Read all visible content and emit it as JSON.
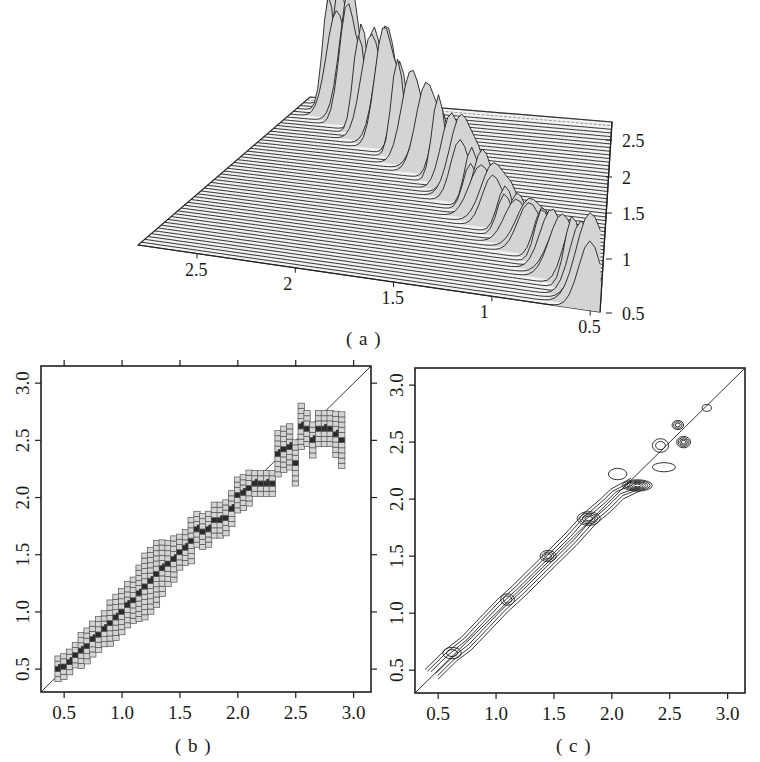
{
  "captions": {
    "a": "( a )",
    "b": "( b )",
    "c": "( c )"
  },
  "colors": {
    "ink": "#1f1f1f",
    "fill_light": "#d4d4d4",
    "fill_dark": "#2a2a2a",
    "background": "#ffffff",
    "surface_line": "#555555"
  },
  "chart_data": [
    {
      "id": "a",
      "type": "surface",
      "title": "",
      "description": "3D waterfall/perspective density surface with a diagonal ridge of peaks",
      "x_axis": {
        "ticks": [
          2.5,
          2,
          1.5,
          1,
          0.5
        ],
        "labels": [
          "2.5",
          "2",
          "1.5",
          "1",
          "0.5"
        ]
      },
      "z_axis": {
        "ticks": [
          2.5,
          2,
          1.5,
          1,
          0.5
        ],
        "labels": [
          "2.5",
          "2",
          "1.5",
          "1",
          "0.5"
        ]
      },
      "grid_lines": 52,
      "ridge_peaks": [
        {
          "t": 0.02,
          "x": 0.5,
          "h": 95
        },
        {
          "t": 0.06,
          "x": 0.55,
          "h": 80
        },
        {
          "t": 0.1,
          "x": 0.6,
          "h": 78
        },
        {
          "t": 0.14,
          "x": 0.66,
          "h": 72
        },
        {
          "t": 0.18,
          "x": 0.72,
          "h": 70
        },
        {
          "t": 0.22,
          "x": 0.78,
          "h": 62
        },
        {
          "t": 0.26,
          "x": 0.86,
          "h": 60
        },
        {
          "t": 0.3,
          "x": 0.94,
          "h": 55
        },
        {
          "t": 0.34,
          "x": 1.02,
          "h": 52
        },
        {
          "t": 0.38,
          "x": 1.1,
          "h": 66
        },
        {
          "t": 0.42,
          "x": 1.18,
          "h": 70
        },
        {
          "t": 0.46,
          "x": 1.26,
          "h": 62
        },
        {
          "t": 0.5,
          "x": 1.34,
          "h": 85
        },
        {
          "t": 0.54,
          "x": 1.42,
          "h": 80
        },
        {
          "t": 0.58,
          "x": 1.52,
          "h": 92
        },
        {
          "t": 0.62,
          "x": 1.62,
          "h": 98
        },
        {
          "t": 0.66,
          "x": 1.74,
          "h": 105
        },
        {
          "t": 0.7,
          "x": 1.86,
          "h": 110
        },
        {
          "t": 0.74,
          "x": 1.98,
          "h": 140
        },
        {
          "t": 0.78,
          "x": 2.1,
          "h": 125
        },
        {
          "t": 0.82,
          "x": 2.22,
          "h": 118
        },
        {
          "t": 0.86,
          "x": 2.34,
          "h": 150
        },
        {
          "t": 0.9,
          "x": 2.46,
          "h": 135
        },
        {
          "t": 0.94,
          "x": 2.56,
          "h": 150
        }
      ]
    },
    {
      "id": "b",
      "type": "heatmap",
      "title": "",
      "xlabel": "",
      "ylabel": "",
      "xlim": [
        0.3,
        3.15
      ],
      "ylim": [
        0.3,
        3.15
      ],
      "x_ticks": [
        0.5,
        1.0,
        1.5,
        2.0,
        2.5,
        3.0
      ],
      "x_tick_labels": [
        "0.5",
        "1.0",
        "1.5",
        "2.0",
        "2.5",
        "3.0"
      ],
      "y_ticks": [
        0.5,
        1.0,
        1.5,
        2.0,
        2.5,
        3.0
      ],
      "y_tick_labels": [
        "0.5",
        "1.0",
        "1.5",
        "2.0",
        "2.5",
        "3.0"
      ],
      "reference_line": "y = x",
      "cell_w": 0.06,
      "cell_h": 0.05,
      "path": [
        [
          0.45,
          0.5
        ],
        [
          0.5,
          0.52
        ],
        [
          0.55,
          0.56
        ],
        [
          0.6,
          0.62
        ],
        [
          0.65,
          0.66
        ],
        [
          0.7,
          0.7
        ],
        [
          0.75,
          0.76
        ],
        [
          0.8,
          0.8
        ],
        [
          0.85,
          0.85
        ],
        [
          0.9,
          0.9
        ],
        [
          0.95,
          0.95
        ],
        [
          1.0,
          1.0
        ],
        [
          1.05,
          1.06
        ],
        [
          1.1,
          1.1
        ],
        [
          1.15,
          1.16
        ],
        [
          1.2,
          1.22
        ],
        [
          1.25,
          1.27
        ],
        [
          1.3,
          1.33
        ],
        [
          1.35,
          1.38
        ],
        [
          1.4,
          1.42
        ],
        [
          1.45,
          1.46
        ],
        [
          1.5,
          1.52
        ],
        [
          1.55,
          1.56
        ],
        [
          1.6,
          1.62
        ],
        [
          1.65,
          1.72
        ],
        [
          1.7,
          1.7
        ],
        [
          1.75,
          1.72
        ],
        [
          1.8,
          1.8
        ],
        [
          1.85,
          1.8
        ],
        [
          1.9,
          1.82
        ],
        [
          1.95,
          1.9
        ],
        [
          2.0,
          2.02
        ],
        [
          2.05,
          2.04
        ],
        [
          2.1,
          2.08
        ],
        [
          2.15,
          2.12
        ],
        [
          2.2,
          2.12
        ],
        [
          2.25,
          2.12
        ],
        [
          2.3,
          2.12
        ],
        [
          2.35,
          2.38
        ],
        [
          2.4,
          2.42
        ],
        [
          2.45,
          2.44
        ],
        [
          2.5,
          2.3
        ],
        [
          2.55,
          2.62
        ],
        [
          2.6,
          2.6
        ],
        [
          2.65,
          2.5
        ],
        [
          2.7,
          2.6
        ],
        [
          2.75,
          2.6
        ],
        [
          2.8,
          2.6
        ],
        [
          2.85,
          2.55
        ],
        [
          2.9,
          2.5
        ]
      ],
      "spread": [
        2,
        2,
        2,
        2,
        3,
        3,
        3,
        3,
        3,
        4,
        4,
        4,
        4,
        4,
        5,
        6,
        6,
        6,
        5,
        4,
        4,
        3,
        3,
        4,
        3,
        3,
        3,
        3,
        3,
        3,
        3,
        3,
        3,
        3,
        2,
        2,
        2,
        2,
        4,
        4,
        4,
        4,
        4,
        3,
        3,
        3,
        3,
        3,
        4,
        5
      ]
    },
    {
      "id": "c",
      "type": "contour",
      "title": "",
      "xlabel": "",
      "ylabel": "",
      "xlim": [
        0.3,
        3.15
      ],
      "ylim": [
        0.3,
        3.15
      ],
      "x_ticks": [
        0.5,
        1.0,
        1.5,
        2.0,
        2.5,
        3.0
      ],
      "x_tick_labels": [
        "0.5",
        "1.0",
        "1.5",
        "2.0",
        "2.5",
        "3.0"
      ],
      "y_ticks": [
        0.5,
        1.0,
        1.5,
        2.0,
        2.5,
        3.0
      ],
      "y_tick_labels": [
        "0.5",
        "1.0",
        "1.5",
        "2.0",
        "2.5",
        "3.0"
      ],
      "reference_line": "y = x",
      "ridge": [
        [
          0.45,
          0.47
        ],
        [
          0.6,
          0.62
        ],
        [
          0.75,
          0.74
        ],
        [
          0.9,
          0.9
        ],
        [
          1.05,
          1.06
        ],
        [
          1.2,
          1.2
        ],
        [
          1.35,
          1.35
        ],
        [
          1.5,
          1.5
        ],
        [
          1.65,
          1.65
        ],
        [
          1.8,
          1.82
        ],
        [
          1.95,
          1.95
        ],
        [
          2.05,
          2.05
        ],
        [
          2.2,
          2.12
        ]
      ],
      "blobs": [
        {
          "x": 2.22,
          "y": 2.12,
          "rx": 0.13,
          "ry": 0.05,
          "levels": 6
        },
        {
          "x": 1.8,
          "y": 1.83,
          "rx": 0.1,
          "ry": 0.06,
          "levels": 4
        },
        {
          "x": 1.45,
          "y": 1.5,
          "rx": 0.07,
          "ry": 0.05,
          "levels": 3
        },
        {
          "x": 1.1,
          "y": 1.12,
          "rx": 0.06,
          "ry": 0.05,
          "levels": 2
        },
        {
          "x": 0.62,
          "y": 0.65,
          "rx": 0.08,
          "ry": 0.05,
          "levels": 2
        },
        {
          "x": 2.62,
          "y": 2.5,
          "rx": 0.06,
          "ry": 0.05,
          "levels": 4
        },
        {
          "x": 2.57,
          "y": 2.65,
          "rx": 0.05,
          "ry": 0.04,
          "levels": 3
        },
        {
          "x": 2.45,
          "y": 2.28,
          "rx": 0.1,
          "ry": 0.04,
          "levels": 1
        },
        {
          "x": 2.42,
          "y": 2.47,
          "rx": 0.07,
          "ry": 0.06,
          "levels": 2
        },
        {
          "x": 2.82,
          "y": 2.8,
          "rx": 0.04,
          "ry": 0.03,
          "levels": 1
        },
        {
          "x": 2.05,
          "y": 2.22,
          "rx": 0.08,
          "ry": 0.05,
          "levels": 1
        }
      ]
    }
  ]
}
